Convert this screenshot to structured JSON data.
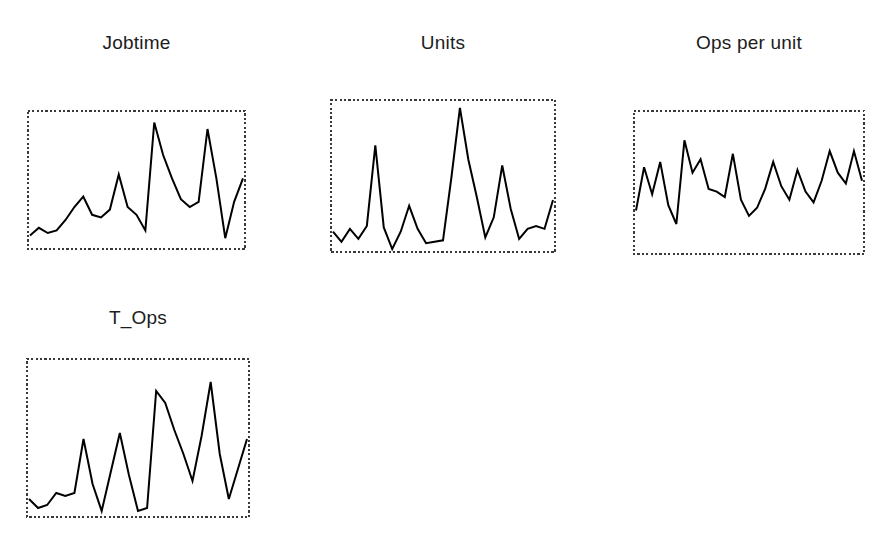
{
  "figure": {
    "background_color": "#ffffff",
    "width": 890,
    "height": 540,
    "line_color": "#000000",
    "frame_color": "#3a3a3a",
    "title_color": "#1c1c1c"
  },
  "panels": [
    {
      "name": "jobtime",
      "title": "Jobtime",
      "title_left": 27,
      "title_top": 33,
      "title_width": 219,
      "frame": {
        "left": 27,
        "top": 110,
        "width": 219,
        "height": 140
      }
    },
    {
      "name": "units",
      "title": "Units",
      "title_left": 330,
      "title_top": 33,
      "title_width": 226,
      "frame": {
        "left": 330,
        "top": 99,
        "width": 226,
        "height": 154
      }
    },
    {
      "name": "ops-per-unit",
      "title": "Ops per unit",
      "title_left": 633,
      "title_top": 33,
      "title_width": 232,
      "frame": {
        "left": 633,
        "top": 110,
        "width": 232,
        "height": 145
      }
    },
    {
      "name": "t-ops",
      "title": "T_Ops",
      "title_left": 26,
      "title_top": 308,
      "title_width": 224,
      "frame": {
        "left": 26,
        "top": 358,
        "width": 224,
        "height": 160
      }
    }
  ],
  "chart_data": [
    {
      "type": "line",
      "name": "jobtime",
      "title": "Jobtime",
      "xlabel": "",
      "ylabel": "",
      "grid": false,
      "legend": "none",
      "axes_visible": false,
      "frame_style": "dotted-rectangle",
      "x": [
        1,
        2,
        3,
        4,
        5,
        6,
        7,
        8,
        9,
        10,
        11,
        12,
        13,
        14,
        15,
        16,
        17,
        18,
        19,
        20,
        21,
        22,
        23,
        24,
        25
      ],
      "values": [
        0.08,
        0.14,
        0.1,
        0.12,
        0.2,
        0.3,
        0.38,
        0.24,
        0.22,
        0.28,
        0.55,
        0.3,
        0.24,
        0.12,
        0.95,
        0.7,
        0.52,
        0.36,
        0.3,
        0.34,
        0.9,
        0.52,
        0.06,
        0.34,
        0.52
      ],
      "ylim": [
        0,
        1
      ]
    },
    {
      "type": "line",
      "name": "units",
      "title": "Units",
      "xlabel": "",
      "ylabel": "",
      "grid": false,
      "legend": "none",
      "axes_visible": false,
      "frame_style": "dotted-rectangle",
      "x": [
        1,
        2,
        3,
        4,
        5,
        6,
        7,
        8,
        9,
        10,
        11,
        12,
        13,
        14,
        15,
        16,
        17,
        18,
        19,
        20,
        21,
        22,
        23,
        24,
        25,
        26,
        27
      ],
      "values": [
        0.12,
        0.05,
        0.14,
        0.07,
        0.16,
        0.72,
        0.15,
        0.0,
        0.12,
        0.3,
        0.14,
        0.04,
        0.05,
        0.06,
        0.5,
        0.98,
        0.62,
        0.36,
        0.08,
        0.22,
        0.58,
        0.28,
        0.07,
        0.14,
        0.16,
        0.14,
        0.34
      ],
      "ylim": [
        0,
        1
      ]
    },
    {
      "type": "line",
      "name": "ops_per_unit",
      "title": "Ops per unit",
      "xlabel": "",
      "ylabel": "",
      "grid": false,
      "legend": "none",
      "axes_visible": false,
      "frame_style": "dotted-rectangle",
      "x": [
        1,
        2,
        3,
        4,
        5,
        6,
        7,
        8,
        9,
        10,
        11,
        12,
        13,
        14,
        15,
        16,
        17,
        18,
        19,
        20,
        21,
        22,
        23,
        24,
        25,
        26,
        27,
        28,
        29
      ],
      "values": [
        0.3,
        0.62,
        0.42,
        0.66,
        0.34,
        0.2,
        0.82,
        0.58,
        0.68,
        0.46,
        0.44,
        0.4,
        0.72,
        0.38,
        0.26,
        0.32,
        0.46,
        0.66,
        0.48,
        0.38,
        0.6,
        0.44,
        0.36,
        0.52,
        0.74,
        0.58,
        0.5,
        0.74,
        0.52
      ],
      "ylim": [
        0,
        1
      ]
    },
    {
      "type": "line",
      "name": "t_ops",
      "title": "T_Ops",
      "xlabel": "",
      "ylabel": "",
      "grid": false,
      "legend": "none",
      "axes_visible": false,
      "frame_style": "dotted-rectangle",
      "x": [
        1,
        2,
        3,
        4,
        5,
        6,
        7,
        8,
        9,
        10,
        11,
        12,
        13,
        14,
        15,
        16,
        17,
        18,
        19,
        20,
        21,
        22,
        23,
        24,
        25
      ],
      "values": [
        0.1,
        0.04,
        0.06,
        0.14,
        0.12,
        0.14,
        0.5,
        0.2,
        0.02,
        0.28,
        0.54,
        0.26,
        0.02,
        0.04,
        0.82,
        0.74,
        0.56,
        0.4,
        0.22,
        0.52,
        0.88,
        0.4,
        0.1,
        0.3,
        0.5
      ],
      "ylim": [
        0,
        1
      ]
    }
  ]
}
